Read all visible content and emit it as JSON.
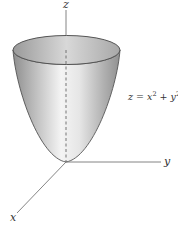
{
  "figure": {
    "axes": {
      "z_label": "z",
      "y_label": "y",
      "x_label": "x"
    },
    "equation": {
      "lhs": "z",
      "equals": "=",
      "term1_base": "x",
      "term1_exp": "2",
      "plus": "+",
      "term2_base": "y",
      "term2_exp": "2",
      "full_text": "z = x² + y²"
    },
    "colors": {
      "surface_light": "#f2f2f2",
      "surface_mid": "#c8c8c8",
      "surface_dark": "#8a8a8a",
      "rim_inner": "#b5b5b5",
      "outline": "#555555",
      "axis": "#777777"
    }
  }
}
